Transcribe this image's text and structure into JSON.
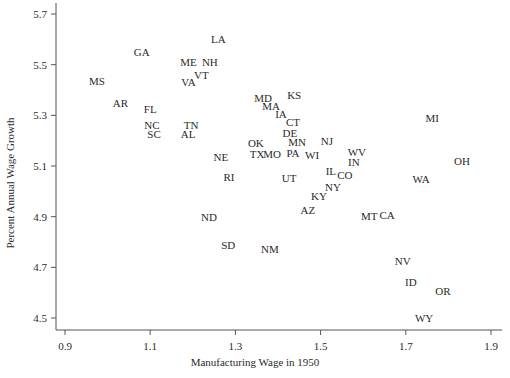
{
  "chart_data": {
    "type": "scatter",
    "title": "",
    "xlabel": "Manufacturing Wage in 1950",
    "ylabel": "Percent Annual Wage Growth",
    "xlim": [
      0.875,
      1.93
    ],
    "ylim": [
      4.47,
      5.74
    ],
    "xticks": [
      0.9,
      1.1,
      1.3,
      1.5,
      1.7,
      1.9
    ],
    "xtick_labels": [
      "0.9",
      "1.1",
      "1.3",
      "1.5",
      "1.7",
      "1.9"
    ],
    "yticks": [
      4.5,
      4.7,
      4.9,
      5.1,
      5.3,
      5.5,
      5.7
    ],
    "ytick_labels": [
      "4.5",
      "4.7",
      "4.9",
      "5.1",
      "5.3",
      "5.5",
      "5.7"
    ],
    "grid": false,
    "legend": null,
    "marker": "text-label",
    "points": [
      {
        "label": "LA",
        "x": 1.26,
        "y": 5.6
      },
      {
        "label": "GA",
        "x": 1.08,
        "y": 5.55
      },
      {
        "label": "ME",
        "x": 1.19,
        "y": 5.51
      },
      {
        "label": "NH",
        "x": 1.24,
        "y": 5.51
      },
      {
        "label": "VT",
        "x": 1.22,
        "y": 5.46
      },
      {
        "label": "VA",
        "x": 1.19,
        "y": 5.43
      },
      {
        "label": "MS",
        "x": 0.975,
        "y": 5.435
      },
      {
        "label": "AR",
        "x": 1.03,
        "y": 5.35
      },
      {
        "label": "FL",
        "x": 1.1,
        "y": 5.325
      },
      {
        "label": "NC",
        "x": 1.104,
        "y": 5.26
      },
      {
        "label": "SC",
        "x": 1.109,
        "y": 5.226
      },
      {
        "label": "TN",
        "x": 1.196,
        "y": 5.26
      },
      {
        "label": "AL",
        "x": 1.189,
        "y": 5.226
      },
      {
        "label": "MD",
        "x": 1.365,
        "y": 5.37
      },
      {
        "label": "KS",
        "x": 1.438,
        "y": 5.38
      },
      {
        "label": "MA",
        "x": 1.384,
        "y": 5.337
      },
      {
        "label": "IA",
        "x": 1.407,
        "y": 5.305
      },
      {
        "label": "CT",
        "x": 1.435,
        "y": 5.274
      },
      {
        "label": "DE",
        "x": 1.428,
        "y": 5.23
      },
      {
        "label": "OK",
        "x": 1.348,
        "y": 5.19
      },
      {
        "label": "MN",
        "x": 1.445,
        "y": 5.195
      },
      {
        "label": "NJ",
        "x": 1.515,
        "y": 5.2
      },
      {
        "label": "TX",
        "x": 1.351,
        "y": 5.147
      },
      {
        "label": "MO",
        "x": 1.386,
        "y": 5.147
      },
      {
        "label": "PA",
        "x": 1.435,
        "y": 5.151
      },
      {
        "label": "WI",
        "x": 1.48,
        "y": 5.143
      },
      {
        "label": "WV",
        "x": 1.585,
        "y": 5.155
      },
      {
        "label": "IN",
        "x": 1.578,
        "y": 5.116
      },
      {
        "label": "NE",
        "x": 1.266,
        "y": 5.135
      },
      {
        "label": "RI",
        "x": 1.285,
        "y": 5.057
      },
      {
        "label": "UT",
        "x": 1.426,
        "y": 5.053
      },
      {
        "label": "IL",
        "x": 1.524,
        "y": 5.08
      },
      {
        "label": "CO",
        "x": 1.557,
        "y": 5.064
      },
      {
        "label": "NY",
        "x": 1.529,
        "y": 5.017
      },
      {
        "label": "KY",
        "x": 1.496,
        "y": 4.981
      },
      {
        "label": "AZ",
        "x": 1.47,
        "y": 4.926
      },
      {
        "label": "MI",
        "x": 1.762,
        "y": 5.289
      },
      {
        "label": "OH",
        "x": 1.832,
        "y": 5.12
      },
      {
        "label": "WA",
        "x": 1.736,
        "y": 5.049
      },
      {
        "label": "MT",
        "x": 1.614,
        "y": 4.902
      },
      {
        "label": "CA",
        "x": 1.656,
        "y": 4.906
      },
      {
        "label": "ND",
        "x": 1.238,
        "y": 4.899
      },
      {
        "label": "SD",
        "x": 1.283,
        "y": 4.788
      },
      {
        "label": "NM",
        "x": 1.381,
        "y": 4.772
      },
      {
        "label": "NV",
        "x": 1.693,
        "y": 4.725
      },
      {
        "label": "ID",
        "x": 1.712,
        "y": 4.642
      },
      {
        "label": "OR",
        "x": 1.787,
        "y": 4.606
      },
      {
        "label": "WY",
        "x": 1.743,
        "y": 4.5
      }
    ]
  },
  "style": {
    "axis_color": "#555555",
    "text_color": "#2a2a2a",
    "background": "#ffffff"
  }
}
